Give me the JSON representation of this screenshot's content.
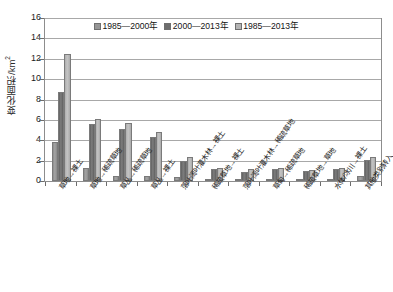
{
  "chart": {
    "type": "bar",
    "y_axis_title_text": "变化面积/km",
    "y_axis_title_sup": "2"
  },
  "legend": {
    "position": "top-center",
    "items": [
      {
        "label": "1985—2000年",
        "color": "#969696"
      },
      {
        "label": "2000—2013年",
        "color": "#6e6e6e"
      },
      {
        "label": "1985—2013年",
        "color": "#b4b4b4"
      }
    ]
  },
  "y_axis": {
    "ticks": [
      "0",
      "2",
      "4",
      "6",
      "8",
      "10",
      "12",
      "14",
      "16"
    ],
    "min": 0,
    "max": 16,
    "step": 2,
    "grid": true
  },
  "chart_data": {
    "type": "bar",
    "title": "",
    "xlabel": "",
    "ylabel": "变化面积/km²",
    "ylim": [
      0,
      16
    ],
    "grid": true,
    "legend_position": "top-center",
    "categories": [
      "草地→裸土",
      "草地→稀疏草地",
      "草丛→稀疏草地",
      "草丛→裸土",
      "落叶阔叶灌木林→裸土",
      "稀疏草地→裸土",
      "落叶阔叶灌木林→稀疏草地",
      "草甸→稀疏草地",
      "稀疏草地→草地",
      "水体/冰川→裸土",
      "其他类别转入"
    ],
    "series": [
      {
        "name": "1985—2000年",
        "color": "#969696",
        "values": [
          3.8,
          1.3,
          0.5,
          0.5,
          0.4,
          0.2,
          0.15,
          0.2,
          0.15,
          0.2,
          0.5
        ]
      },
      {
        "name": "2000—2013年",
        "color": "#6e6e6e",
        "values": [
          8.7,
          5.6,
          5.1,
          4.3,
          2.0,
          1.2,
          0.9,
          1.2,
          1.0,
          1.2,
          2.1
        ]
      },
      {
        "name": "1985—2013年",
        "color": "#b4b4b4",
        "values": [
          12.5,
          6.1,
          5.7,
          4.8,
          2.4,
          1.3,
          1.2,
          1.3,
          1.1,
          1.3,
          2.4
        ]
      }
    ]
  }
}
